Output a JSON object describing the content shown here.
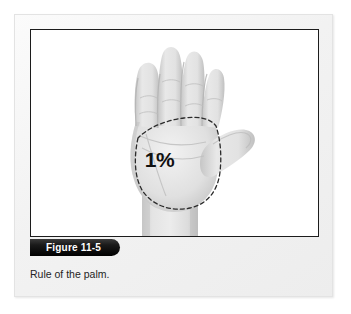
{
  "figure": {
    "number_label": "Figure 11-5",
    "caption": "Rule of the palm.",
    "image": {
      "overlay_value": "1%",
      "subject": "open-hand-palm-photograph",
      "outline_style": "dashed",
      "colors": {
        "plate_background": "#ffffff",
        "plate_border": "#1c1c1c",
        "card_background": "#f4f4f4",
        "tab_background": "#000000",
        "tab_text": "#ffffff",
        "overlay_text": "#111111",
        "caption_text": "#242424",
        "skin_light": "#e9e9e9",
        "skin_mid": "#d4d4d4",
        "skin_shadow": "#b5b5b5",
        "outline_dash": "#2b2b2b"
      }
    }
  }
}
